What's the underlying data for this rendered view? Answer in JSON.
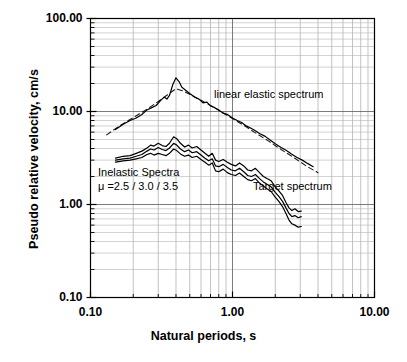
{
  "chart_data": {
    "type": "line",
    "title": "",
    "xlabel": "Natural periods, s",
    "ylabel": "Pseudo relative velocity, cm/s",
    "xscale": "log",
    "yscale": "log",
    "xlim": [
      0.1,
      10.0
    ],
    "ylim": [
      0.1,
      100.0
    ],
    "grid": true,
    "grid_minor": true,
    "xticks": [
      0.1,
      1.0,
      10.0
    ],
    "xtick_labels": [
      "0.10",
      "1.00",
      "10.00"
    ],
    "yticks": [
      0.1,
      1.0,
      10.0,
      100.0
    ],
    "ytick_labels": [
      "0.10",
      "1.00",
      "10.00",
      "100.00"
    ],
    "legend_position": "inline-annotations",
    "annotations": [
      {
        "name": "linear-elastic-spectrum-label",
        "text": "linear elastic spectrum",
        "x_px": 214,
        "y_px": 88
      },
      {
        "name": "target-spectrum-label",
        "text": "Target spectrum",
        "x_px": 253,
        "y_px": 180
      },
      {
        "name": "inelastic-spectra-label",
        "text": "Inelastic Spectra",
        "x_px": 98,
        "y_px": 166
      },
      {
        "name": "mu-values-label",
        "text": "μ =2.5 / 3.0 / 3.5",
        "x_px": 98,
        "y_px": 180
      }
    ],
    "series": [
      {
        "name": "Target spectrum",
        "style": "dashed",
        "color": "#1a1a1a",
        "points": [
          [
            0.13,
            5.6
          ],
          [
            0.16,
            7.0
          ],
          [
            0.2,
            8.6
          ],
          [
            0.25,
            10.6
          ],
          [
            0.3,
            12.8
          ],
          [
            0.35,
            15.2
          ],
          [
            0.4,
            17.6
          ],
          [
            0.45,
            16.6
          ],
          [
            0.5,
            15.3
          ],
          [
            0.6,
            13.2
          ],
          [
            0.7,
            11.6
          ],
          [
            0.8,
            10.3
          ],
          [
            1.0,
            8.4
          ],
          [
            1.2,
            7.1
          ],
          [
            1.5,
            5.7
          ],
          [
            1.8,
            4.8
          ],
          [
            2.2,
            3.9
          ],
          [
            2.7,
            3.2
          ],
          [
            3.3,
            2.6
          ],
          [
            4.0,
            2.2
          ]
        ]
      },
      {
        "name": "linear elastic spectrum",
        "style": "solid",
        "color": "#000000",
        "points": [
          [
            0.15,
            6.4
          ],
          [
            0.17,
            7.3
          ],
          [
            0.19,
            8.0
          ],
          [
            0.21,
            8.5
          ],
          [
            0.23,
            9.3
          ],
          [
            0.25,
            10.4
          ],
          [
            0.27,
            11.0
          ],
          [
            0.29,
            11.6
          ],
          [
            0.31,
            13.0
          ],
          [
            0.33,
            14.3
          ],
          [
            0.345,
            13.6
          ],
          [
            0.36,
            14.9
          ],
          [
            0.38,
            19.5
          ],
          [
            0.4,
            23.0
          ],
          [
            0.42,
            21.0
          ],
          [
            0.44,
            18.2
          ],
          [
            0.47,
            16.8
          ],
          [
            0.5,
            15.6
          ],
          [
            0.54,
            14.3
          ],
          [
            0.58,
            13.6
          ],
          [
            0.62,
            12.4
          ],
          [
            0.66,
            12.6
          ],
          [
            0.7,
            11.5
          ],
          [
            0.75,
            11.0
          ],
          [
            0.8,
            10.4
          ],
          [
            0.86,
            9.6
          ],
          [
            0.92,
            9.3
          ],
          [
            1.0,
            8.5
          ],
          [
            1.08,
            8.0
          ],
          [
            1.16,
            7.6
          ],
          [
            1.25,
            7.0
          ],
          [
            1.35,
            6.6
          ],
          [
            1.45,
            6.2
          ],
          [
            1.55,
            5.8
          ],
          [
            1.7,
            5.4
          ],
          [
            1.85,
            4.9
          ],
          [
            2.0,
            4.5
          ],
          [
            2.2,
            4.1
          ],
          [
            2.4,
            3.8
          ],
          [
            2.6,
            3.5
          ],
          [
            2.85,
            3.2
          ],
          [
            3.1,
            3.0
          ],
          [
            3.4,
            2.75
          ],
          [
            3.7,
            2.55
          ]
        ]
      },
      {
        "name": "Inelastic spectrum mu=2.5",
        "style": "solid",
        "color": "#000000",
        "points": [
          [
            0.15,
            3.15
          ],
          [
            0.17,
            3.3
          ],
          [
            0.19,
            3.35
          ],
          [
            0.21,
            3.55
          ],
          [
            0.23,
            3.75
          ],
          [
            0.25,
            4.05
          ],
          [
            0.265,
            4.35
          ],
          [
            0.28,
            4.25
          ],
          [
            0.3,
            4.55
          ],
          [
            0.32,
            4.3
          ],
          [
            0.34,
            4.2
          ],
          [
            0.36,
            4.55
          ],
          [
            0.385,
            5.35
          ],
          [
            0.405,
            5.1
          ],
          [
            0.43,
            4.55
          ],
          [
            0.46,
            4.15
          ],
          [
            0.49,
            4.35
          ],
          [
            0.52,
            4.05
          ],
          [
            0.56,
            4.2
          ],
          [
            0.6,
            3.85
          ],
          [
            0.64,
            3.55
          ],
          [
            0.68,
            3.3
          ],
          [
            0.72,
            3.55
          ],
          [
            0.76,
            3.0
          ],
          [
            0.8,
            2.9
          ],
          [
            0.86,
            3.05
          ],
          [
            0.92,
            2.85
          ],
          [
            0.98,
            2.7
          ],
          [
            1.05,
            2.6
          ],
          [
            1.12,
            2.8
          ],
          [
            1.2,
            2.6
          ],
          [
            1.28,
            2.35
          ],
          [
            1.36,
            2.3
          ],
          [
            1.45,
            2.45
          ],
          [
            1.55,
            2.2
          ],
          [
            1.65,
            2.0
          ],
          [
            1.75,
            1.9
          ],
          [
            1.87,
            1.8
          ],
          [
            2.0,
            1.55
          ],
          [
            2.12,
            1.4
          ],
          [
            2.25,
            1.25
          ],
          [
            2.38,
            1.05
          ],
          [
            2.5,
            0.92
          ],
          [
            2.62,
            0.86
          ],
          [
            2.75,
            0.9
          ],
          [
            2.9,
            0.84
          ],
          [
            3.05,
            0.85
          ]
        ]
      },
      {
        "name": "Inelastic spectrum mu=3.0",
        "style": "solid",
        "color": "#000000",
        "points": [
          [
            0.15,
            3.0
          ],
          [
            0.17,
            3.1
          ],
          [
            0.19,
            3.15
          ],
          [
            0.21,
            3.3
          ],
          [
            0.23,
            3.45
          ],
          [
            0.25,
            3.75
          ],
          [
            0.265,
            3.95
          ],
          [
            0.28,
            3.85
          ],
          [
            0.3,
            4.1
          ],
          [
            0.32,
            3.9
          ],
          [
            0.34,
            3.8
          ],
          [
            0.36,
            4.05
          ],
          [
            0.385,
            4.55
          ],
          [
            0.405,
            4.35
          ],
          [
            0.43,
            3.95
          ],
          [
            0.46,
            3.7
          ],
          [
            0.49,
            3.85
          ],
          [
            0.52,
            3.6
          ],
          [
            0.56,
            3.7
          ],
          [
            0.6,
            3.4
          ],
          [
            0.64,
            3.15
          ],
          [
            0.68,
            2.95
          ],
          [
            0.72,
            3.1
          ],
          [
            0.76,
            2.6
          ],
          [
            0.8,
            2.55
          ],
          [
            0.86,
            2.7
          ],
          [
            0.92,
            2.5
          ],
          [
            0.98,
            2.35
          ],
          [
            1.05,
            2.3
          ],
          [
            1.12,
            2.45
          ],
          [
            1.2,
            2.25
          ],
          [
            1.28,
            2.05
          ],
          [
            1.36,
            2.0
          ],
          [
            1.45,
            2.1
          ],
          [
            1.55,
            1.9
          ],
          [
            1.65,
            1.75
          ],
          [
            1.75,
            1.65
          ],
          [
            1.87,
            1.55
          ],
          [
            2.0,
            1.35
          ],
          [
            2.12,
            1.22
          ],
          [
            2.25,
            1.08
          ],
          [
            2.38,
            0.92
          ],
          [
            2.5,
            0.8
          ],
          [
            2.62,
            0.74
          ],
          [
            2.75,
            0.76
          ],
          [
            2.9,
            0.72
          ],
          [
            3.05,
            0.74
          ]
        ]
      },
      {
        "name": "Inelastic spectrum mu=3.5",
        "style": "solid",
        "color": "#000000",
        "points": [
          [
            0.15,
            2.85
          ],
          [
            0.17,
            2.95
          ],
          [
            0.19,
            3.0
          ],
          [
            0.21,
            3.1
          ],
          [
            0.23,
            3.2
          ],
          [
            0.25,
            3.45
          ],
          [
            0.265,
            3.55
          ],
          [
            0.28,
            3.4
          ],
          [
            0.3,
            3.55
          ],
          [
            0.32,
            3.45
          ],
          [
            0.34,
            3.35
          ],
          [
            0.36,
            3.55
          ],
          [
            0.385,
            3.95
          ],
          [
            0.405,
            3.8
          ],
          [
            0.43,
            3.5
          ],
          [
            0.46,
            3.3
          ],
          [
            0.49,
            3.4
          ],
          [
            0.52,
            3.2
          ],
          [
            0.56,
            3.3
          ],
          [
            0.6,
            3.05
          ],
          [
            0.64,
            2.85
          ],
          [
            0.68,
            2.65
          ],
          [
            0.72,
            2.8
          ],
          [
            0.76,
            2.3
          ],
          [
            0.8,
            2.25
          ],
          [
            0.86,
            2.4
          ],
          [
            0.92,
            2.2
          ],
          [
            0.98,
            2.1
          ],
          [
            1.05,
            2.05
          ],
          [
            1.12,
            2.18
          ],
          [
            1.2,
            2.0
          ],
          [
            1.28,
            1.85
          ],
          [
            1.36,
            1.8
          ],
          [
            1.45,
            1.9
          ],
          [
            1.55,
            1.7
          ],
          [
            1.65,
            1.58
          ],
          [
            1.75,
            1.48
          ],
          [
            1.87,
            1.38
          ],
          [
            2.0,
            1.2
          ],
          [
            2.12,
            1.08
          ],
          [
            2.25,
            0.95
          ],
          [
            2.38,
            0.8
          ],
          [
            2.5,
            0.68
          ],
          [
            2.62,
            0.62
          ],
          [
            2.75,
            0.6
          ],
          [
            2.9,
            0.57
          ],
          [
            3.05,
            0.58
          ]
        ]
      }
    ]
  },
  "axes": {
    "x_title": "Natural periods, s",
    "y_title": "Pseudo relative velocity, cm/s"
  }
}
